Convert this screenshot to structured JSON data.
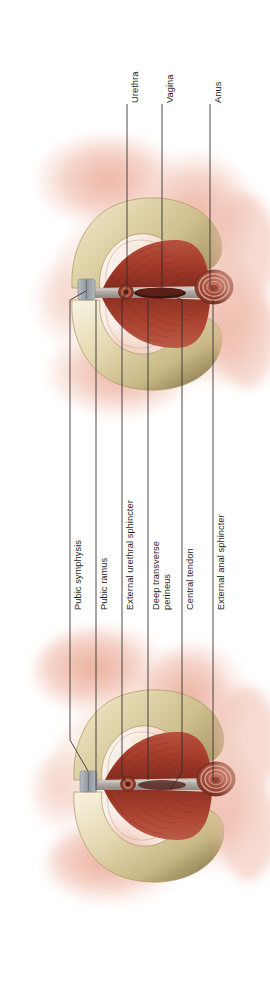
{
  "figure": {
    "type": "anatomical-illustration",
    "orientation": "labels-rotated-90-ccw",
    "views": [
      {
        "id": "upper-view",
        "name": "upper-pelvic-view"
      },
      {
        "id": "lower-view",
        "name": "lower-pelvic-view"
      }
    ]
  },
  "palette": {
    "background": "#ffffff",
    "skin_light": "#f8e2db",
    "skin_mid": "#f0bfb0",
    "skin_deep": "#e9a895",
    "bone_light": "#eee5c6",
    "bone_mid": "#ded2a8",
    "bone_shadow": "#b6a673",
    "muscle_light": "#c0614e",
    "muscle_mid": "#a8402f",
    "muscle_dark": "#7e2a1e",
    "tendon": "#b9b3ae",
    "symphysis": "#9aa0a6",
    "leader_line": "#2a2a2a",
    "label_text": "#1d1d1d"
  },
  "labels_top": [
    {
      "key": "urethra",
      "text": "Urethra",
      "x": 127,
      "text_bottom": 103,
      "line_top": 104,
      "line_bottom": 292
    },
    {
      "key": "vagina",
      "text": "Vagina",
      "x": 162,
      "text_bottom": 103,
      "line_top": 104,
      "line_bottom": 296
    },
    {
      "key": "anus",
      "text": "Anus",
      "x": 210,
      "text_bottom": 103,
      "line_top": 104,
      "line_bottom": 287
    }
  ],
  "labels_bottom": [
    {
      "key": "pubic-symphysis",
      "text": "Pubic symphysis",
      "x": 70,
      "text_bottom": 610,
      "line_top": 455,
      "line_bottom": 755
    },
    {
      "key": "pubic-ramus",
      "text": "Pubic ramus",
      "x": 96,
      "text_bottom": 610,
      "line_top": 430,
      "line_bottom": 778
    },
    {
      "key": "external-urethral-sphincter",
      "text": "External urethral sphincter",
      "x": 122,
      "text_bottom": 610,
      "line_top": 400,
      "line_bottom": 786
    },
    {
      "key": "deep-transverse-perineus",
      "text_line1": "Deep transverse",
      "text_line2": "perineus",
      "x": 148,
      "text_bottom": 610,
      "line_top": 418,
      "line_bottom": 780
    },
    {
      "key": "central-tendon",
      "text": "Central tendon",
      "x": 182,
      "text_bottom": 610,
      "line_top": 432,
      "line_bottom": 786
    },
    {
      "key": "external-anal-sphincter",
      "text": "External anal sphincter",
      "x": 213,
      "text_bottom": 610,
      "line_top": 395,
      "line_bottom": 780
    }
  ]
}
